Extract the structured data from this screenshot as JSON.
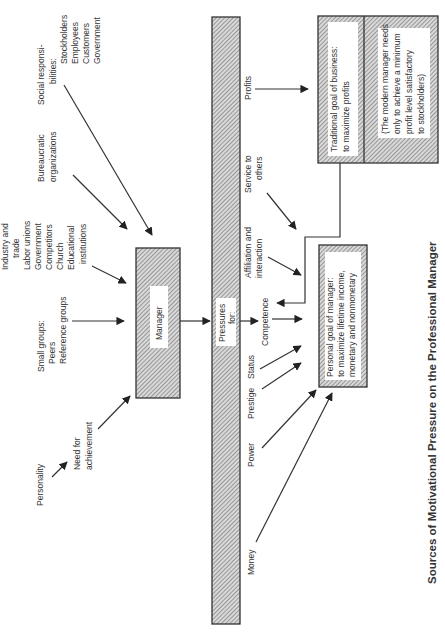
{
  "figure": {
    "title": "Sources of Motivational Pressure on the Professional Manager",
    "orientation": "rotated -90deg (landscape page)",
    "colors": {
      "ink": "#333333",
      "hatch": "#8a8a8a",
      "paper": "#ffffff"
    }
  },
  "sources": {
    "social": {
      "l1": "Social responsi-",
      "l2": "bilities:",
      "l3": "Stockholders",
      "l4": "Employees",
      "l5": "Customers",
      "l6": "Government"
    },
    "bureaucratic": {
      "l1": "Bureaucratic",
      "l2": "organizations"
    },
    "industry": {
      "l1": "Industry and",
      "l2": "trade",
      "l3": "Labor unions",
      "l4": "Government",
      "l5": "Competitors",
      "l6": "Church",
      "l7": "Educational",
      "l8": "institutions"
    },
    "small_groups": {
      "l1": "Small groups:",
      "l2": "Peers",
      "l3": "Reference groups"
    },
    "need": {
      "l1": "Need for",
      "l2": "achievement"
    },
    "personality": "Personality"
  },
  "manager_box": {
    "label": "Manager"
  },
  "pressures_bar": {
    "l1": "Pressures",
    "l2": "for:"
  },
  "pressures": {
    "profits": "Profits",
    "service": {
      "l1": "Service to",
      "l2": "others"
    },
    "affiliation": {
      "l1": "Affiliation and",
      "l2": "interaction"
    },
    "competence": "Competence",
    "status": "Status",
    "prestige": "Prestige",
    "power": "Power",
    "money": "Money"
  },
  "business_goal_box": {
    "primary": {
      "l1": "Traditional  goal  of  business:",
      "l2": "to  maximize  profits"
    },
    "note": {
      "l1": "(The modern manager needs",
      "l2": "only to achieve a minimum",
      "l3": "profit level satisfactory",
      "l4": "to stockholders)"
    }
  },
  "personal_goal_box": {
    "l1": "Personal goal of manager:",
    "l2": "to maximize lifetime income,",
    "l3": "monetary and nonmonetary"
  }
}
